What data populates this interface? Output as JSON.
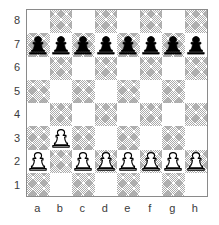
{
  "diagram": {
    "type": "chess-board-diagram",
    "orientation": "white-bottom",
    "rank_labels": [
      "8",
      "7",
      "6",
      "5",
      "4",
      "3",
      "2",
      "1"
    ],
    "file_labels": [
      "a",
      "b",
      "c",
      "d",
      "e",
      "f",
      "g",
      "h"
    ],
    "colors": {
      "light_square": "#ffffff",
      "dark_square": "#a9a9a9",
      "border": "#8a8a8a",
      "label_text": "#3b3b3b",
      "black_piece_fill": "#000000",
      "white_piece_fill": "#ffffff",
      "piece_outline": "#000000"
    },
    "position": {
      "fen_placement": "8/pppppppp/8/8/8/1P6/P1PPPPPP/8",
      "ranks": [
        {
          "rank": "8",
          "squares": [
            {
              "square": "a8",
              "shade": "light",
              "piece": null
            },
            {
              "square": "b8",
              "shade": "dark",
              "piece": null
            },
            {
              "square": "c8",
              "shade": "light",
              "piece": null
            },
            {
              "square": "d8",
              "shade": "dark",
              "piece": null
            },
            {
              "square": "e8",
              "shade": "light",
              "piece": null
            },
            {
              "square": "f8",
              "shade": "dark",
              "piece": null
            },
            {
              "square": "g8",
              "shade": "light",
              "piece": null
            },
            {
              "square": "h8",
              "shade": "dark",
              "piece": null
            }
          ]
        },
        {
          "rank": "7",
          "squares": [
            {
              "square": "a7",
              "shade": "dark",
              "piece": "black-pawn"
            },
            {
              "square": "b7",
              "shade": "light",
              "piece": "black-pawn"
            },
            {
              "square": "c7",
              "shade": "dark",
              "piece": "black-pawn"
            },
            {
              "square": "d7",
              "shade": "light",
              "piece": "black-pawn"
            },
            {
              "square": "e7",
              "shade": "dark",
              "piece": "black-pawn"
            },
            {
              "square": "f7",
              "shade": "light",
              "piece": "black-pawn"
            },
            {
              "square": "g7",
              "shade": "dark",
              "piece": "black-pawn"
            },
            {
              "square": "h7",
              "shade": "light",
              "piece": "black-pawn"
            }
          ]
        },
        {
          "rank": "6",
          "squares": [
            {
              "square": "a6",
              "shade": "light",
              "piece": null
            },
            {
              "square": "b6",
              "shade": "dark",
              "piece": null
            },
            {
              "square": "c6",
              "shade": "light",
              "piece": null
            },
            {
              "square": "d6",
              "shade": "dark",
              "piece": null
            },
            {
              "square": "e6",
              "shade": "light",
              "piece": null
            },
            {
              "square": "f6",
              "shade": "dark",
              "piece": null
            },
            {
              "square": "g6",
              "shade": "light",
              "piece": null
            },
            {
              "square": "h6",
              "shade": "dark",
              "piece": null
            }
          ]
        },
        {
          "rank": "5",
          "squares": [
            {
              "square": "a5",
              "shade": "dark",
              "piece": null
            },
            {
              "square": "b5",
              "shade": "light",
              "piece": null
            },
            {
              "square": "c5",
              "shade": "dark",
              "piece": null
            },
            {
              "square": "d5",
              "shade": "light",
              "piece": null
            },
            {
              "square": "e5",
              "shade": "dark",
              "piece": null
            },
            {
              "square": "f5",
              "shade": "light",
              "piece": null
            },
            {
              "square": "g5",
              "shade": "dark",
              "piece": null
            },
            {
              "square": "h5",
              "shade": "light",
              "piece": null
            }
          ]
        },
        {
          "rank": "4",
          "squares": [
            {
              "square": "a4",
              "shade": "light",
              "piece": null
            },
            {
              "square": "b4",
              "shade": "dark",
              "piece": null
            },
            {
              "square": "c4",
              "shade": "light",
              "piece": null
            },
            {
              "square": "d4",
              "shade": "dark",
              "piece": null
            },
            {
              "square": "e4",
              "shade": "light",
              "piece": null
            },
            {
              "square": "f4",
              "shade": "dark",
              "piece": null
            },
            {
              "square": "g4",
              "shade": "light",
              "piece": null
            },
            {
              "square": "h4",
              "shade": "dark",
              "piece": null
            }
          ]
        },
        {
          "rank": "3",
          "squares": [
            {
              "square": "a3",
              "shade": "dark",
              "piece": null
            },
            {
              "square": "b3",
              "shade": "light",
              "piece": "white-pawn"
            },
            {
              "square": "c3",
              "shade": "dark",
              "piece": null
            },
            {
              "square": "d3",
              "shade": "light",
              "piece": null
            },
            {
              "square": "e3",
              "shade": "dark",
              "piece": null
            },
            {
              "square": "f3",
              "shade": "light",
              "piece": null
            },
            {
              "square": "g3",
              "shade": "dark",
              "piece": null
            },
            {
              "square": "h3",
              "shade": "light",
              "piece": null
            }
          ]
        },
        {
          "rank": "2",
          "squares": [
            {
              "square": "a2",
              "shade": "light",
              "piece": "white-pawn"
            },
            {
              "square": "b2",
              "shade": "dark",
              "piece": null
            },
            {
              "square": "c2",
              "shade": "light",
              "piece": "white-pawn"
            },
            {
              "square": "d2",
              "shade": "dark",
              "piece": "white-pawn"
            },
            {
              "square": "e2",
              "shade": "light",
              "piece": "white-pawn"
            },
            {
              "square": "f2",
              "shade": "dark",
              "piece": "white-pawn"
            },
            {
              "square": "g2",
              "shade": "light",
              "piece": "white-pawn"
            },
            {
              "square": "h2",
              "shade": "dark",
              "piece": "white-pawn"
            }
          ]
        },
        {
          "rank": "1",
          "squares": [
            {
              "square": "a1",
              "shade": "dark",
              "piece": null
            },
            {
              "square": "b1",
              "shade": "light",
              "piece": null
            },
            {
              "square": "c1",
              "shade": "dark",
              "piece": null
            },
            {
              "square": "d1",
              "shade": "light",
              "piece": null
            },
            {
              "square": "e1",
              "shade": "dark",
              "piece": null
            },
            {
              "square": "f1",
              "shade": "light",
              "piece": null
            },
            {
              "square": "g1",
              "shade": "dark",
              "piece": null
            },
            {
              "square": "h1",
              "shade": "light",
              "piece": null
            }
          ]
        }
      ]
    }
  }
}
